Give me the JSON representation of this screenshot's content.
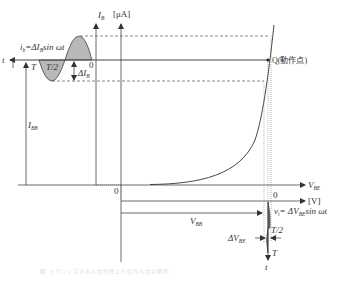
{
  "diagram": {
    "axes": {
      "y_axis_label": "I",
      "y_axis_sub": "B",
      "y_axis_unit": "[μA]",
      "x_axis_label": "V",
      "x_axis_sub": "BE",
      "x_axis_unit": "[V]",
      "time_axis_left": "t",
      "time_axis_bottom": "t",
      "origin_main": "0",
      "origin_sine_left": "0",
      "origin_sine_bottom": "0"
    },
    "labels": {
      "ib_formula_prefix": "i",
      "ib_formula_sub": "b",
      "ib_formula_rest": "=ΔI",
      "ib_formula_sub2": "B",
      "ib_formula_tail": "sin ωt",
      "T_left": "T",
      "T2_left": "T/2",
      "delta_ib": "ΔI",
      "delta_ib_sub": "B",
      "ibb": "I",
      "ibb_sub": "BB",
      "q_point": "Q(動作点)",
      "vbb": "V",
      "vbb_sub": "BB",
      "vi_formula_prefix": "v",
      "vi_formula_sub": "i",
      "vi_formula_rest": "= ΔV",
      "vi_formula_sub2": "BE",
      "vi_formula_tail": "sin ωt",
      "T2_bottom": "T/2",
      "T_bottom": "T",
      "delta_vbe": "ΔV",
      "delta_vbe_sub": "BE"
    },
    "caption": "図 トランジスタの入力特性と小信号入力の関係"
  },
  "colors": {
    "line": "#444444",
    "fill": "#b8b8b8",
    "dashed": "#555555"
  }
}
